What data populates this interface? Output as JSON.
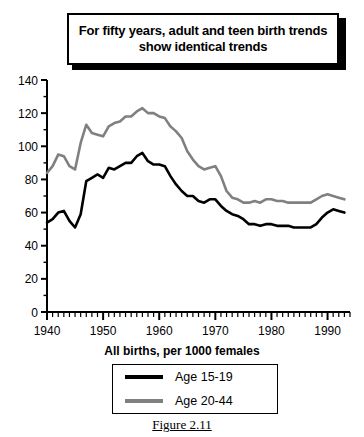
{
  "title": {
    "text": "For fifty years, adult and teen birth trends show identical trends"
  },
  "legend": {
    "heading": "All births, per 1000 females",
    "entries": [
      {
        "label": "Age 15-19",
        "color": "#000000"
      },
      {
        "label": "Age 20-44",
        "color": "#808080"
      }
    ]
  },
  "caption": "Figure 2.11",
  "chart_data": {
    "type": "line",
    "title": "For fifty years, adult and teen birth trends show identical trends",
    "xlabel": "",
    "ylabel": "",
    "xlim": [
      1940,
      1994
    ],
    "ylim": [
      0,
      140
    ],
    "ytick_step": 20,
    "yticks": [
      0,
      20,
      40,
      60,
      80,
      100,
      120,
      140
    ],
    "xticks": [
      1940,
      1950,
      1960,
      1970,
      1980,
      1990
    ],
    "xtick_labels": [
      "1940",
      "1950",
      "1960",
      "1970",
      "1980",
      "1990"
    ],
    "x_minor_tick_step": 1,
    "y_minor_tick_step": 10,
    "grid": false,
    "legend_position": "bottom",
    "x": [
      1940,
      1941,
      1942,
      1943,
      1944,
      1945,
      1946,
      1947,
      1948,
      1949,
      1950,
      1951,
      1952,
      1953,
      1954,
      1955,
      1956,
      1957,
      1958,
      1959,
      1960,
      1961,
      1962,
      1963,
      1964,
      1965,
      1966,
      1967,
      1968,
      1969,
      1970,
      1971,
      1972,
      1973,
      1974,
      1975,
      1976,
      1977,
      1978,
      1979,
      1980,
      1981,
      1982,
      1983,
      1984,
      1985,
      1986,
      1987,
      1988,
      1989,
      1990,
      1991,
      1992,
      1993
    ],
    "series": [
      {
        "name": "Age 15-19",
        "color": "#000000",
        "values": [
          54,
          56,
          60,
          61,
          55,
          51,
          59,
          79,
          81,
          83,
          81,
          87,
          86,
          88,
          90,
          90,
          94,
          96,
          91,
          89,
          89,
          88,
          82,
          77,
          73,
          70,
          70,
          67,
          66,
          68,
          68,
          64,
          61,
          59,
          58,
          56,
          53,
          53,
          52,
          53,
          53,
          52,
          52,
          52,
          51,
          51,
          51,
          51,
          53,
          57,
          60,
          62,
          61,
          60
        ]
      },
      {
        "name": "Age 20-44",
        "color": "#808080",
        "values": [
          84,
          88,
          95,
          94,
          88,
          86,
          102,
          113,
          108,
          107,
          106,
          112,
          114,
          115,
          118,
          118,
          121,
          123,
          120,
          120,
          118,
          117,
          112,
          109,
          105,
          97,
          92,
          88,
          86,
          87,
          88,
          82,
          73,
          69,
          68,
          66,
          66,
          67,
          66,
          68,
          68,
          67,
          67,
          66,
          66,
          66,
          66,
          66,
          68,
          70,
          71,
          70,
          69,
          68
        ]
      }
    ]
  }
}
